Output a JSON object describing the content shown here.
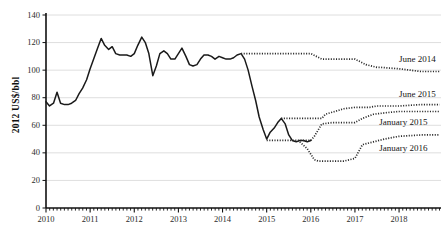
{
  "chart_data": {
    "type": "line",
    "title": "",
    "xlabel": "",
    "ylabel": "2012 US$/bbl",
    "xlim": [
      2010.0,
      2018.95
    ],
    "ylim": [
      0,
      140
    ],
    "grid": true,
    "legend_position": "right-inline",
    "ytick_labels": [
      "0",
      "20",
      "40",
      "60",
      "80",
      "100",
      "120",
      "140"
    ],
    "ytick_values": [
      0,
      20,
      40,
      60,
      80,
      100,
      120,
      140
    ],
    "xtick_labels": [
      "2010",
      "2011",
      "2012",
      "2013",
      "2014",
      "2015",
      "2016",
      "2017",
      "2018"
    ],
    "xtick_values": [
      2010,
      2011,
      2012,
      2013,
      2014,
      2015,
      2016,
      2017,
      2018
    ],
    "minor_ticks": "monthly",
    "series": [
      {
        "name": "history",
        "style": "solid",
        "color": "#1a1a1a",
        "label": "",
        "x": [
          2010.0,
          2010.08,
          2010.17,
          2010.25,
          2010.33,
          2010.42,
          2010.5,
          2010.58,
          2010.67,
          2010.75,
          2010.83,
          2010.92,
          2011.0,
          2011.08,
          2011.17,
          2011.25,
          2011.33,
          2011.42,
          2011.5,
          2011.58,
          2011.67,
          2011.75,
          2011.83,
          2011.92,
          2012.0,
          2012.08,
          2012.17,
          2012.25,
          2012.33,
          2012.42,
          2012.5,
          2012.58,
          2012.67,
          2012.75,
          2012.83,
          2012.92,
          2013.0,
          2013.08,
          2013.17,
          2013.25,
          2013.33,
          2013.42,
          2013.5,
          2013.58,
          2013.67,
          2013.75,
          2013.83,
          2013.92,
          2014.0,
          2014.08,
          2014.17,
          2014.25,
          2014.33,
          2014.42,
          2014.5,
          2014.58,
          2014.67,
          2014.75,
          2014.83,
          2014.92,
          2015.0,
          2015.08,
          2015.17,
          2015.25,
          2015.33,
          2015.42,
          2015.5,
          2015.58,
          2015.67,
          2015.75,
          2015.83,
          2015.92,
          2016.0
        ],
        "y": [
          77,
          74,
          76,
          84,
          76,
          75,
          75,
          76,
          78,
          83,
          87,
          93,
          101,
          108,
          116,
          123,
          118,
          115,
          117,
          112,
          111,
          111,
          111,
          110,
          112,
          118,
          124,
          120,
          112,
          96,
          103,
          112,
          114,
          112,
          108,
          108,
          112,
          116,
          110,
          104,
          103,
          104,
          108,
          111,
          111,
          110,
          108,
          110,
          109,
          108,
          108,
          109,
          111,
          112,
          108,
          100,
          88,
          78,
          66,
          57,
          50,
          55,
          58,
          62,
          65,
          61,
          53,
          49,
          48,
          49,
          49,
          48,
          49
        ]
      },
      {
        "name": "June 2014 forecast",
        "label": "June 2014",
        "style": "dotted",
        "color": "#2a2a2a",
        "x": [
          2014.42,
          2015.0,
          2015.5,
          2015.58,
          2016.0,
          2016.25,
          2016.33,
          2016.5,
          2017.0,
          2017.25,
          2017.5,
          2017.58,
          2018.0,
          2018.5,
          2018.92
        ],
        "y": [
          112,
          112,
          112,
          112,
          112,
          108,
          108,
          108,
          108,
          104,
          102,
          102,
          101,
          99,
          99
        ]
      },
      {
        "name": "June 2015 forecast",
        "label": "June 2015",
        "style": "dotted",
        "color": "#2a2a2a",
        "x": [
          2015.33,
          2015.5,
          2015.92,
          2016.0,
          2016.25,
          2016.33,
          2016.75,
          2017.0,
          2017.33,
          2017.5,
          2018.0,
          2018.5,
          2018.92
        ],
        "y": [
          65,
          65,
          65,
          65,
          65,
          68,
          72,
          73,
          73,
          74,
          74,
          75,
          75
        ]
      },
      {
        "name": "January 2015 forecast",
        "label": "January 2015",
        "style": "dotted",
        "color": "#2a2a2a",
        "x": [
          2015.0,
          2015.42,
          2015.83,
          2016.0,
          2016.08,
          2016.25,
          2016.5,
          2017.0,
          2017.17,
          2017.42,
          2017.67,
          2018.0,
          2018.5,
          2018.92
        ],
        "y": [
          49,
          49,
          49,
          49,
          52,
          61,
          62,
          62,
          65,
          68,
          69,
          70,
          70,
          70
        ]
      },
      {
        "name": "January 2016 forecast",
        "label": "January 2016",
        "style": "dotted",
        "color": "#2a2a2a",
        "x": [
          2015.75,
          2015.92,
          2016.08,
          2016.17,
          2016.42,
          2016.75,
          2017.0,
          2017.17,
          2017.42,
          2017.67,
          2018.0,
          2018.5,
          2018.92
        ],
        "y": [
          48,
          43,
          35,
          34,
          34,
          34,
          36,
          46,
          48,
          50,
          52,
          53,
          53
        ]
      }
    ],
    "annotations": [
      {
        "text": "June 2014",
        "x": 2018.0,
        "y": 107
      },
      {
        "text": "June 2015",
        "x": 2018.0,
        "y": 82
      },
      {
        "text": "January 2015",
        "x": 2017.55,
        "y": 62
      },
      {
        "text": "January 2016",
        "x": 2017.55,
        "y": 43
      }
    ]
  },
  "caption": ""
}
